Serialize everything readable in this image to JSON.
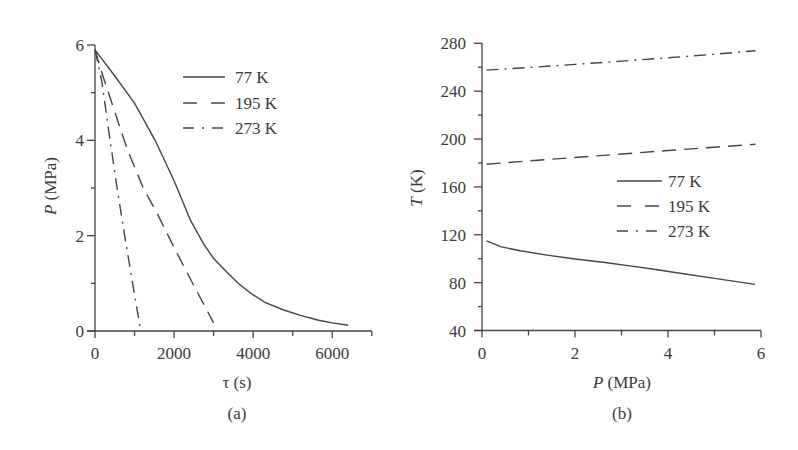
{
  "chart_data": [
    {
      "id": "a",
      "type": "line",
      "caption": "(a)",
      "title": "",
      "xlabel": "τ (s)",
      "ylabel_italic": "P",
      "ylabel_rest": " (MPa)",
      "xlim": [
        0,
        7000
      ],
      "ylim": [
        0,
        6
      ],
      "x_ticks": [
        0,
        2000,
        4000,
        6000
      ],
      "x_minor_ticks": [
        1000,
        3000,
        5000,
        7000
      ],
      "y_ticks": [
        0,
        2,
        4,
        6
      ],
      "y_minor_ticks": [
        1,
        3,
        5
      ],
      "grid": false,
      "legend_position": "upper right",
      "series": [
        {
          "name": "77 K",
          "style": "solid",
          "x": [
            0,
            500,
            1000,
            1520,
            2000,
            2410,
            2740,
            3000,
            3350,
            3650,
            3930,
            4300,
            4770,
            5200,
            5630,
            6000,
            6400
          ],
          "y": [
            5.9,
            5.35,
            4.78,
            4.0,
            3.15,
            2.33,
            1.84,
            1.52,
            1.22,
            0.98,
            0.8,
            0.6,
            0.44,
            0.33,
            0.23,
            0.17,
            0.12
          ]
        },
        {
          "name": "195 K",
          "style": "dashed",
          "x": [
            0,
            200,
            460,
            800,
            1220,
            1570,
            2000,
            2500,
            3000
          ],
          "y": [
            5.9,
            5.35,
            4.7,
            3.85,
            3.0,
            2.47,
            1.75,
            0.95,
            0.17
          ]
        },
        {
          "name": "273 K",
          "style": "dashdot",
          "x": [
            0,
            80,
            180,
            330,
            560,
            750,
            950,
            1140
          ],
          "y": [
            5.9,
            5.6,
            5.2,
            4.3,
            3.0,
            2.0,
            1.0,
            0.08
          ]
        }
      ]
    },
    {
      "id": "b",
      "type": "line",
      "caption": "(b)",
      "title": "",
      "xlabel_italic": "P",
      "xlabel_rest": " (MPa)",
      "ylabel_italic": "T",
      "ylabel_rest": " (K)",
      "xlim": [
        0,
        6
      ],
      "ylim": [
        40,
        280
      ],
      "x_ticks": [
        0,
        2,
        4,
        6
      ],
      "x_minor_ticks": [
        1,
        3,
        5
      ],
      "y_ticks": [
        40,
        80,
        120,
        160,
        200,
        240,
        280
      ],
      "y_minor_ticks": [
        60,
        100,
        140,
        180,
        220,
        260
      ],
      "grid": false,
      "legend_position": "center right",
      "series": [
        {
          "name": "77 K",
          "style": "solid",
          "x": [
            0.1,
            0.4,
            0.82,
            1.4,
            1.96,
            2.6,
            3.18,
            3.7,
            4.19,
            5.0,
            5.87
          ],
          "y": [
            115,
            110,
            106.7,
            103,
            100,
            97,
            94,
            91.2,
            88.3,
            83.5,
            78.5
          ]
        },
        {
          "name": "195 K",
          "style": "dashed",
          "x": [
            0.1,
            1,
            2,
            3,
            4,
            5,
            5.88
          ],
          "y": [
            178.9,
            181.7,
            184.6,
            187.5,
            190.4,
            193.2,
            195.7
          ]
        },
        {
          "name": "273 K",
          "style": "dashdot",
          "x": [
            0.1,
            1,
            2,
            3,
            4,
            5,
            5.88
          ],
          "y": [
            257.6,
            259.8,
            262.4,
            265.1,
            267.9,
            270.9,
            273.8
          ]
        }
      ]
    }
  ],
  "legend": {
    "a": [
      "77 K",
      "195 K",
      "273 K"
    ],
    "b": [
      "77 K",
      "195 K",
      "273 K"
    ]
  },
  "colors": {
    "ink": "#444444",
    "text": "#3a3a3a",
    "background": "#ffffff"
  }
}
